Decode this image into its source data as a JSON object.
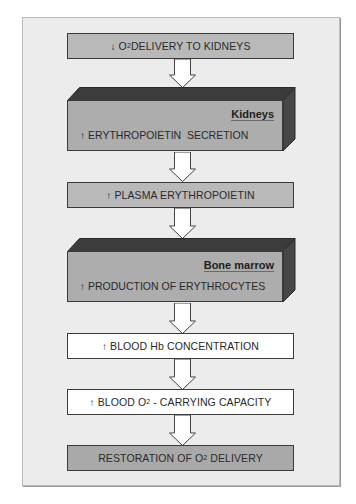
{
  "diagram": {
    "type": "flowchart",
    "steps": [
      {
        "id": "step1",
        "direction": "down",
        "prefix": "O",
        "sub": "2",
        "text": " DELIVERY TO KIDNEYS",
        "style": "grey"
      },
      {
        "id": "step2",
        "organ": "Kidneys",
        "direction": "up",
        "text": "ERYTHROPOIETIN  SECRETION",
        "style": "block"
      },
      {
        "id": "step3",
        "direction": "up",
        "text": "PLASMA ERYTHROPOIETIN",
        "style": "grey"
      },
      {
        "id": "step4",
        "organ": "Bone marrow",
        "direction": "up",
        "text": "PRODUCTION OF ERYTHROCYTES",
        "style": "block"
      },
      {
        "id": "step5",
        "direction": "up",
        "text": "BLOOD Hb CONCENTRATION",
        "style": "white"
      },
      {
        "id": "step6",
        "direction": "up",
        "prefix": "BLOOD O",
        "sub": "2",
        "text": " - CARRYING CAPACITY",
        "style": "white"
      },
      {
        "id": "step7",
        "prefix": "RESTORATION OF O",
        "sub": "2",
        "text": " DELIVERY",
        "style": "darkgrey"
      }
    ],
    "glyphs": {
      "down": "↓",
      "up": "↑"
    },
    "colors": {
      "frame_bg": "#ececec",
      "box_grey": "#b9b9b9",
      "box_white": "#ffffff",
      "block_front": "#adadad",
      "block_top_side": "#3c3c3c",
      "border": "#3a3a3a"
    }
  }
}
